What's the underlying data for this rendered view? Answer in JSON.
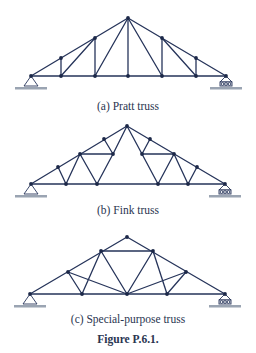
{
  "colors": {
    "member": "#26345a",
    "joint": "#1c2848",
    "ground": "#9aa4b2",
    "text": "#2a3550"
  },
  "panels": [
    {
      "id": "a",
      "caption": "(a) Pratt truss",
      "supports": {
        "pin_at": [
          31,
          76
        ],
        "roller_at": [
          226,
          76
        ]
      },
      "joints": [
        [
          31,
          76
        ],
        [
          61,
          76
        ],
        [
          95,
          76
        ],
        [
          128,
          76
        ],
        [
          162,
          76
        ],
        [
          196,
          76
        ],
        [
          226,
          76
        ],
        [
          61,
          58
        ],
        [
          95,
          38
        ],
        [
          128,
          18
        ],
        [
          162,
          38
        ],
        [
          196,
          58
        ]
      ],
      "members": [
        [
          [
            31,
            76
          ],
          [
            226,
            76
          ]
        ],
        [
          [
            31,
            76
          ],
          [
            128,
            18
          ]
        ],
        [
          [
            128,
            18
          ],
          [
            226,
            76
          ]
        ],
        [
          [
            61,
            76
          ],
          [
            61,
            58
          ]
        ],
        [
          [
            95,
            76
          ],
          [
            95,
            38
          ]
        ],
        [
          [
            128,
            76
          ],
          [
            128,
            18
          ]
        ],
        [
          [
            162,
            76
          ],
          [
            162,
            38
          ]
        ],
        [
          [
            196,
            76
          ],
          [
            196,
            58
          ]
        ],
        [
          [
            61,
            76
          ],
          [
            95,
            38
          ]
        ],
        [
          [
            95,
            76
          ],
          [
            128,
            18
          ]
        ],
        [
          [
            162,
            76
          ],
          [
            128,
            18
          ]
        ],
        [
          [
            196,
            76
          ],
          [
            162,
            38
          ]
        ]
      ]
    },
    {
      "id": "b",
      "caption": "(b) Fink truss",
      "supports": {
        "pin_at": [
          31,
          184
        ],
        "roller_at": [
          225,
          184
        ]
      },
      "joints": [
        [
          31,
          184
        ],
        [
          66,
          184
        ],
        [
          97,
          184
        ],
        [
          158,
          184
        ],
        [
          188,
          184
        ],
        [
          225,
          184
        ],
        [
          58,
          167
        ],
        [
          80,
          154
        ],
        [
          104,
          139
        ],
        [
          127,
          126
        ],
        [
          150,
          139
        ],
        [
          174,
          154
        ],
        [
          197,
          167
        ],
        [
          113,
          154
        ],
        [
          142,
          154
        ]
      ],
      "members": [
        [
          [
            31,
            184
          ],
          [
            225,
            184
          ]
        ],
        [
          [
            31,
            184
          ],
          [
            127,
            126
          ]
        ],
        [
          [
            127,
            126
          ],
          [
            225,
            184
          ]
        ],
        [
          [
            58,
            167
          ],
          [
            66,
            184
          ]
        ],
        [
          [
            66,
            184
          ],
          [
            80,
            154
          ]
        ],
        [
          [
            80,
            154
          ],
          [
            97,
            184
          ]
        ],
        [
          [
            80,
            154
          ],
          [
            113,
            154
          ]
        ],
        [
          [
            104,
            139
          ],
          [
            113,
            154
          ]
        ],
        [
          [
            113,
            154
          ],
          [
            97,
            184
          ]
        ],
        [
          [
            113,
            154
          ],
          [
            127,
            126
          ]
        ],
        [
          [
            197,
            167
          ],
          [
            188,
            184
          ]
        ],
        [
          [
            188,
            184
          ],
          [
            174,
            154
          ]
        ],
        [
          [
            174,
            154
          ],
          [
            158,
            184
          ]
        ],
        [
          [
            174,
            154
          ],
          [
            142,
            154
          ]
        ],
        [
          [
            150,
            139
          ],
          [
            142,
            154
          ]
        ],
        [
          [
            142,
            154
          ],
          [
            158,
            184
          ]
        ],
        [
          [
            142,
            154
          ],
          [
            127,
            126
          ]
        ]
      ]
    },
    {
      "id": "c",
      "caption": "(c) Special-purpose truss",
      "supports": {
        "pin_at": [
          30,
          294
        ],
        "roller_at": [
          225,
          294
        ]
      },
      "joints": [
        [
          30,
          294
        ],
        [
          82,
          294
        ],
        [
          127,
          294
        ],
        [
          167,
          294
        ],
        [
          225,
          294
        ],
        [
          68,
          272
        ],
        [
          101,
          251
        ],
        [
          127,
          237
        ],
        [
          153,
          251
        ],
        [
          186,
          272
        ]
      ],
      "members": [
        [
          [
            30,
            294
          ],
          [
            225,
            294
          ]
        ],
        [
          [
            30,
            294
          ],
          [
            127,
            237
          ]
        ],
        [
          [
            127,
            237
          ],
          [
            225,
            294
          ]
        ],
        [
          [
            101,
            251
          ],
          [
            153,
            251
          ]
        ],
        [
          [
            68,
            272
          ],
          [
            82,
            294
          ]
        ],
        [
          [
            68,
            272
          ],
          [
            127,
            294
          ]
        ],
        [
          [
            101,
            251
          ],
          [
            82,
            294
          ]
        ],
        [
          [
            101,
            251
          ],
          [
            127,
            294
          ]
        ],
        [
          [
            186,
            272
          ],
          [
            167,
            294
          ]
        ],
        [
          [
            186,
            272
          ],
          [
            127,
            294
          ]
        ],
        [
          [
            153,
            251
          ],
          [
            167,
            294
          ]
        ],
        [
          [
            153,
            251
          ],
          [
            127,
            294
          ]
        ]
      ]
    }
  ],
  "figure_title": "Figure P.6.1."
}
